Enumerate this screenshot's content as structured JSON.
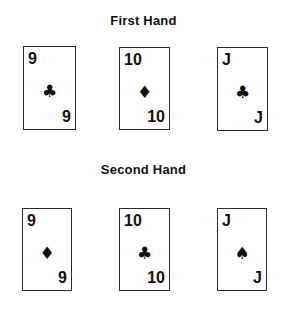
{
  "hands": [
    {
      "title": "First Hand",
      "cards": [
        {
          "rank": "9",
          "suit": "clubs",
          "suit_glyph": "♣"
        },
        {
          "rank": "10",
          "suit": "diamonds",
          "suit_glyph": "♦"
        },
        {
          "rank": "J",
          "suit": "clubs",
          "suit_glyph": "♣"
        }
      ]
    },
    {
      "title": "Second Hand",
      "cards": [
        {
          "rank": "9",
          "suit": "diamonds",
          "suit_glyph": "♦"
        },
        {
          "rank": "10",
          "suit": "clubs",
          "suit_glyph": "♣"
        },
        {
          "rank": "J",
          "suit": "spades",
          "suit_glyph": "♠"
        }
      ]
    }
  ]
}
